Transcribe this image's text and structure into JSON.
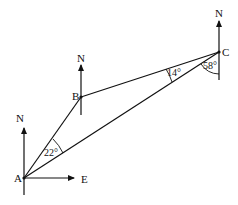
{
  "diagram": {
    "type": "bearing-triangle",
    "points": {
      "A": {
        "label": "A",
        "x": 24,
        "y": 178
      },
      "B": {
        "label": "B",
        "x": 81,
        "y": 97
      },
      "C": {
        "label": "C",
        "x": 219,
        "y": 52
      }
    },
    "north_label": "N",
    "east_label": "E",
    "angles": {
      "at_A": "22°",
      "at_B_C_side": "14°",
      "at_C": "58°"
    },
    "colors": {
      "line": "#111111",
      "background": "#ffffff"
    }
  }
}
